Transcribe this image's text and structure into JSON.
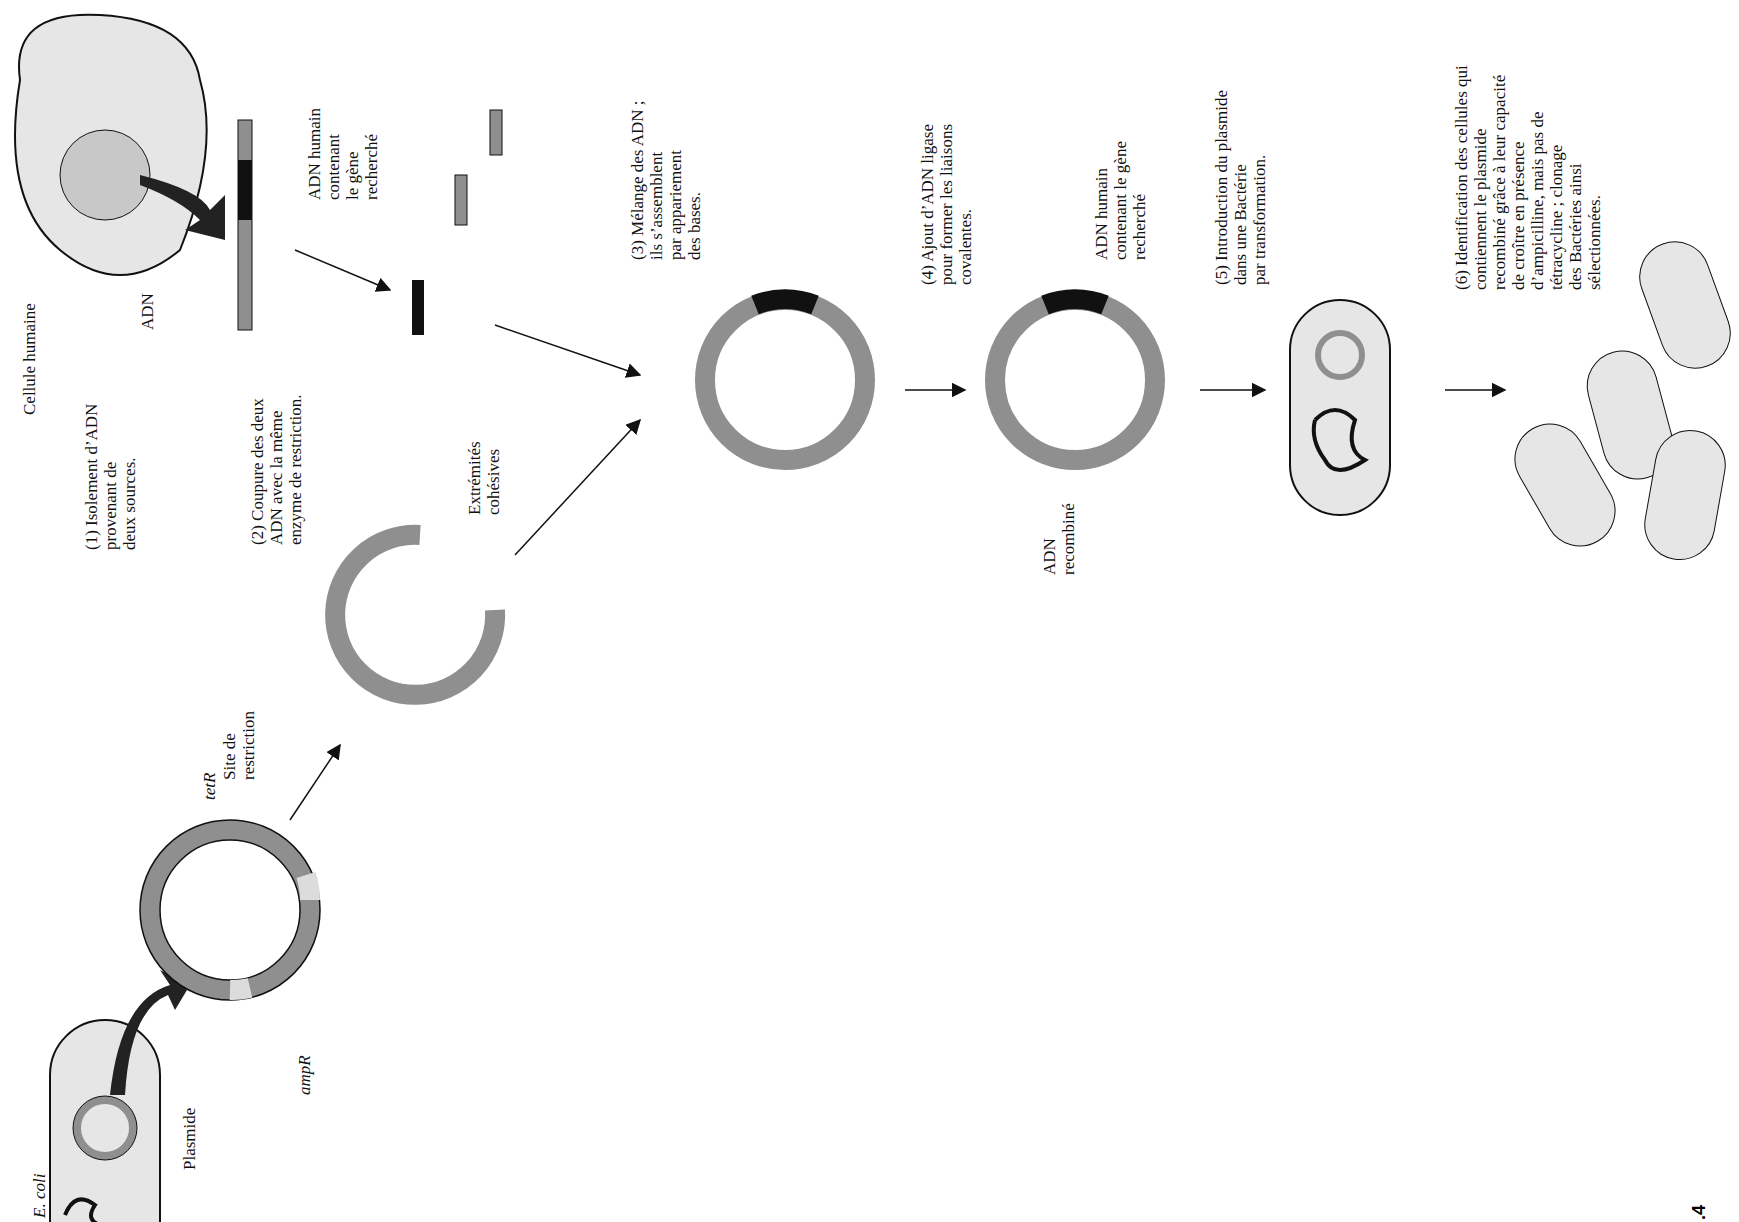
{
  "figure": {
    "number_label": ".4",
    "colors": {
      "dna_gray": "#8f8f8f",
      "light_gray": "#dcdcdc",
      "cell_fill": "#e6e6e6",
      "insert": "#111111"
    }
  },
  "labels": {
    "ecoli": "E. coli",
    "plasmide": "Plasmide",
    "ampR": "ampR",
    "tetR": "tetR",
    "site_restriction": "Site de\nrestriction",
    "cellule_humaine": "Cellule humaine",
    "adn": "ADN",
    "adn_humain_gene": "ADN humain\ncontenant\nle gène\nrecherché",
    "extremites": "Extrémités\ncohésives",
    "adn_humain_gene2": "ADN humain\ncontenant le gène\nrecherché",
    "adn_recombine": "ADN\nrecombiné"
  },
  "steps": [
    {
      "num": "1",
      "text": "Isolement d’ADN\nprovenant de\ndeux sources."
    },
    {
      "num": "2",
      "text": "Coupure des deux\nADN avec la même\nenzyme de restriction."
    },
    {
      "num": "3",
      "text": "Mélange des ADN ;\nils s’assemblent\npar appariement\ndes bases."
    },
    {
      "num": "4",
      "text": "Ajout d’ADN ligase\npour former les liaisons\ncovalentes."
    },
    {
      "num": "5",
      "text": "Introduction du plasmide\ndans une Bactérie\npar transformation."
    },
    {
      "num": "6",
      "text": "Identification des cellules qui\ncontiennent le plasmide\nrecombiné grâce à leur capacité\nde croître en présence\nd’ampicilline, mais pas de\ntétracycline ; clonage\ndes Bactéries ainsi\nsélectionnées."
    }
  ]
}
